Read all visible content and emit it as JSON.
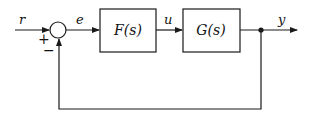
{
  "diagram": {
    "type": "feedback-control-block-diagram",
    "signals": {
      "reference": "r",
      "error": "e",
      "control": "u",
      "output": "y"
    },
    "summing_junction": {
      "plus_sign": "+",
      "minus_sign": "−"
    },
    "blocks": [
      {
        "id": "controller",
        "label": "F(s)"
      },
      {
        "id": "plant",
        "label": "G(s)"
      }
    ],
    "colors": {
      "stroke": "#1a1a1a",
      "background": "#ffffff"
    }
  }
}
